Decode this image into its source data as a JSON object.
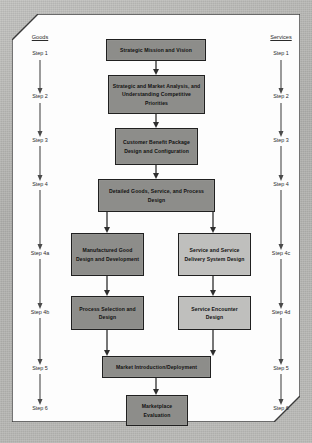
{
  "figure": {
    "background_color": "#b5b5b2",
    "frame_color": "#fdfdfd",
    "box_dark_color": "#8d8d8a",
    "box_light_color": "#bfbfbd",
    "line_color": "#2e2e2e"
  },
  "left_rail": {
    "heading": "Goods",
    "steps": [
      {
        "label": "Step 1"
      },
      {
        "label": "Step 2"
      },
      {
        "label": "Step 3"
      },
      {
        "label": "Step 4"
      },
      {
        "label": "Step 4a"
      },
      {
        "label": "Step 4b"
      },
      {
        "label": "Step 5"
      },
      {
        "label": "Step 6"
      }
    ]
  },
  "right_rail": {
    "heading": "Services",
    "steps": [
      {
        "label": "Step 1"
      },
      {
        "label": "Step 2"
      },
      {
        "label": "Step 3"
      },
      {
        "label": "Step 4"
      },
      {
        "label": "Step 4c"
      },
      {
        "label": "Step 4d"
      },
      {
        "label": "Step 5"
      },
      {
        "label": "Step 6"
      }
    ]
  },
  "nodes": {
    "strategic_mission": "Strategic Mission and Vision",
    "strategic_analysis": "Strategic and Market Analysis, and Understanding Competitive Priorities",
    "customer_benefit": "Customer Benefit Package Design and Configuration",
    "detailed_design": "Detailed Goods, Service, and Process Design",
    "manufactured_good": "Manufactured Good Design and Development",
    "service_delivery": "Service and Service Delivery System Design",
    "process_selection": "Process Selection and Design",
    "service_encounter": "Service Encounter Design",
    "market_introduction": "Market Introduction/Deployment",
    "marketplace_evaluation": "Marketplace Evaluation"
  }
}
